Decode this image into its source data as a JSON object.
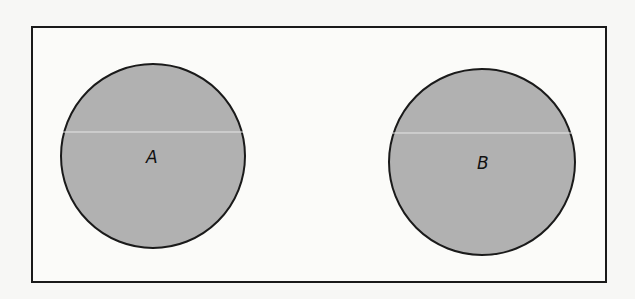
{
  "diagram": {
    "type": "venn",
    "universe": {
      "x": 32,
      "y": 27,
      "width": 574,
      "height": 255
    },
    "sets": [
      {
        "label": "A",
        "cx": 153,
        "cy": 156,
        "r": 92,
        "fill": "#b1b1b1"
      },
      {
        "label": "B",
        "cx": 482,
        "cy": 162,
        "r": 93,
        "fill": "#b1b1b1"
      }
    ],
    "relationship": "disjoint"
  }
}
